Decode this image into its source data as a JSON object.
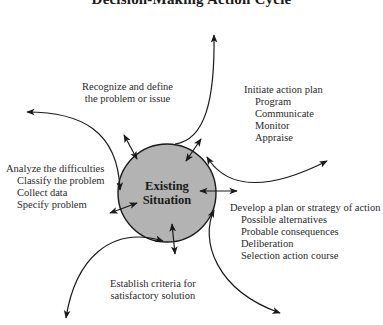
{
  "title": "Decision-Making Action Cycle",
  "center": {
    "line1": "Existing",
    "line2": "Situation",
    "fill": "#b3b3b3"
  },
  "stages": [
    {
      "heading_line1": "Recognize and define",
      "heading_line2": "the problem or issue",
      "items": []
    },
    {
      "heading": "Initiate action plan",
      "items": [
        "Program",
        "Communicate",
        "Monitor",
        "Appraise"
      ]
    },
    {
      "heading": "Develop a plan or strategy of action",
      "items": [
        "Possible alternatives",
        "Probable consequences",
        "Deliberation",
        "Selection action course"
      ]
    },
    {
      "heading_line1": "Establish criteria for",
      "heading_line2": "satisfactory solution",
      "items": []
    },
    {
      "heading": "Analyze the difficulties",
      "items": [
        "Classify the problem",
        "Collect data",
        "Specify problem"
      ]
    }
  ],
  "colors": {
    "line": "#1a1a1a",
    "text": "#2a2a2a"
  }
}
